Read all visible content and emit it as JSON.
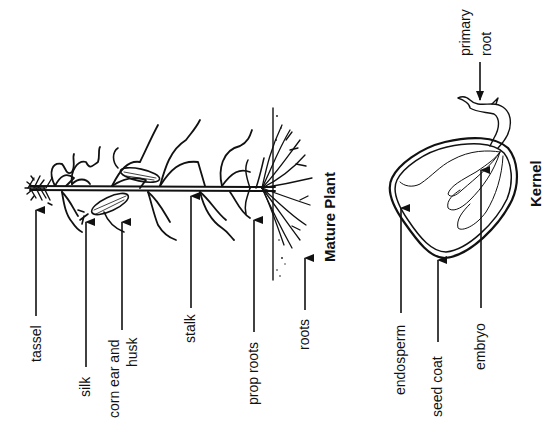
{
  "diagram": {
    "orientation": "rotated -90deg (text reads bottom-to-top)",
    "colors": {
      "ink": "#111111",
      "background": "#ffffff"
    }
  },
  "mature_plant": {
    "title": "Mature Plant",
    "labels": [
      {
        "id": "tassel",
        "text": "tassel"
      },
      {
        "id": "silk",
        "text": "silk"
      },
      {
        "id": "corn-ear",
        "line1": "corn ear and",
        "line2": "husk"
      },
      {
        "id": "stalk",
        "text": "stalk"
      },
      {
        "id": "prop-roots",
        "text": "prop roots"
      },
      {
        "id": "roots",
        "text": "roots"
      }
    ]
  },
  "kernel": {
    "title": "Kernel",
    "labels": [
      {
        "id": "primary-root",
        "line1": "primary",
        "line2": "root"
      },
      {
        "id": "endosperm",
        "text": "endosperm"
      },
      {
        "id": "seed-coat",
        "text": "seed coat"
      },
      {
        "id": "embryo",
        "text": "embryo"
      }
    ]
  }
}
